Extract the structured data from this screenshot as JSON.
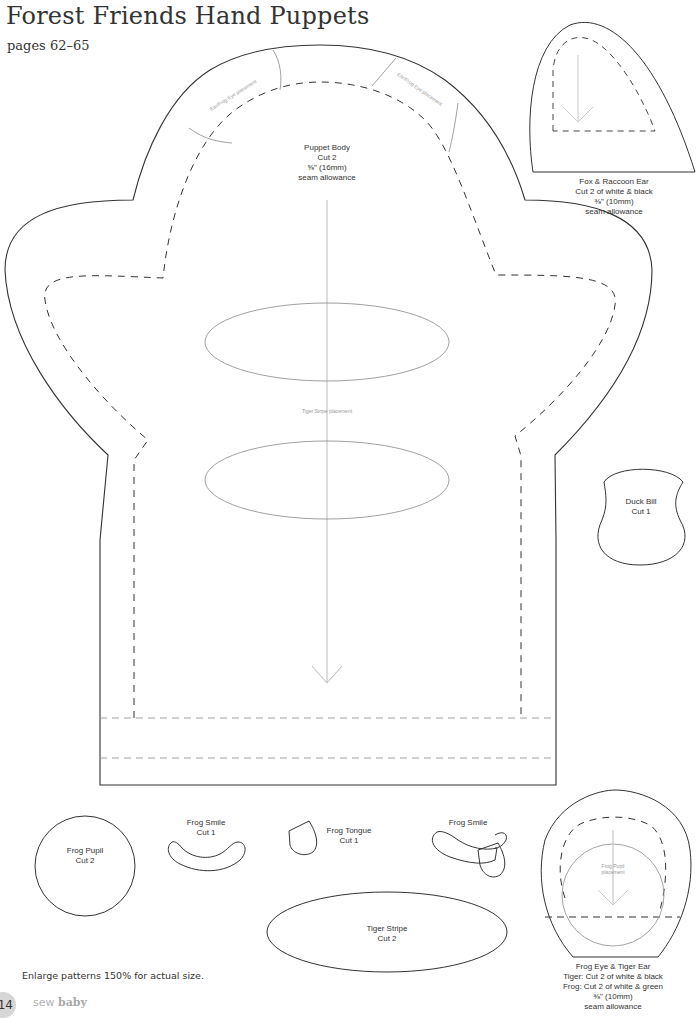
{
  "header": {
    "title": "Forest Friends Hand Puppets",
    "subtitle": "pages 62–65"
  },
  "pieces": {
    "puppet_body": {
      "name": "Puppet Body",
      "cut": "Cut 2",
      "seam": "⅝\" (16mm)",
      "seam_note": "seam allowance",
      "ear_placement_left": "Ear/Frog Eye placement",
      "ear_placement_right": "Ear/Frog Eye placement",
      "stripe_placement": "Tiger Stripe placement"
    },
    "fox_raccoon_ear": {
      "name": "Fox & Raccoon Ear",
      "cut": "Cut 2 of white & black",
      "seam": "⅜\" (10mm)",
      "seam_note": "seam allowance"
    },
    "duck_bill": {
      "name": "Duck Bill",
      "cut": "Cut 1"
    },
    "frog_pupil": {
      "name": "Frog Pupil",
      "cut": "Cut 2"
    },
    "frog_smile": {
      "name": "Frog Smile",
      "cut": "Cut 1"
    },
    "frog_tongue": {
      "name": "Frog Tongue",
      "cut": "Cut 1"
    },
    "frog_smile_assembled": {
      "name": "Frog Smile"
    },
    "tiger_stripe": {
      "name": "Tiger Stripe",
      "cut": "Cut 2"
    },
    "frog_eye_tiger_ear": {
      "name": "Frog Eye & Tiger Ear",
      "tiger_cut": "Tiger: Cut 2 of white & black",
      "frog_cut": "Frog: Cut 2 of white & green",
      "seam": "⅜\" (10mm)",
      "seam_note": "seam allowance",
      "pupil_placement_1": "Frog Pupil",
      "pupil_placement_2": "placement"
    }
  },
  "footer": {
    "note": "Enlarge patterns 150% for actual size.",
    "page_number": "114",
    "brand_light": "sew",
    "brand_bold": "baby"
  },
  "colors": {
    "outline": "#333333",
    "guide": "#9a9a9a",
    "page_badge": "#d6d6d6"
  }
}
